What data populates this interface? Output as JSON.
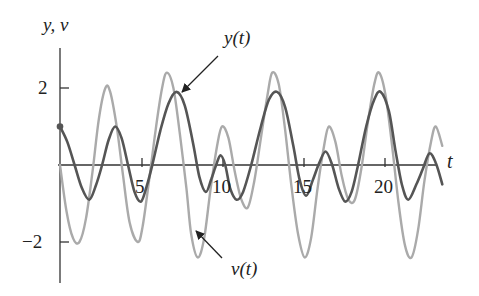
{
  "chart_data": {
    "type": "line",
    "title": "",
    "xlabel": "t",
    "ylabel": "y, v",
    "xlim": [
      0,
      23
    ],
    "ylim": [
      -3,
      3
    ],
    "grid": false,
    "x_ticks": [
      5,
      10,
      15,
      20
    ],
    "x_tick_labels": [
      "5",
      "10",
      "15",
      "20"
    ],
    "y_ticks": [
      2,
      -2
    ],
    "y_tick_labels": [
      "2",
      "−2"
    ],
    "legend": "annotations with arrows",
    "series": [
      {
        "name": "y(t)",
        "color": "#555555",
        "width": 2.6,
        "initial_point": [
          0,
          1.0
        ],
        "points": [
          [
            0,
            1.0
          ],
          [
            0.45,
            0.6
          ],
          [
            0.9,
            0.0
          ],
          [
            1.35,
            -0.6
          ],
          [
            1.8,
            -0.9
          ],
          [
            2.2,
            -0.55
          ],
          [
            2.6,
            0.0
          ],
          [
            3.0,
            0.65
          ],
          [
            3.4,
            1.0
          ],
          [
            3.8,
            0.7
          ],
          [
            4.2,
            0.0
          ],
          [
            4.6,
            -0.7
          ],
          [
            5.0,
            -0.95
          ],
          [
            5.35,
            -0.55
          ],
          [
            5.7,
            0.0
          ],
          [
            6.2,
            0.9
          ],
          [
            6.7,
            1.6
          ],
          [
            7.2,
            1.9
          ],
          [
            7.7,
            1.55
          ],
          [
            8.2,
            0.6
          ],
          [
            8.6,
            -0.3
          ],
          [
            9.0,
            -0.7
          ],
          [
            9.35,
            -0.35
          ],
          [
            9.6,
            -0.05
          ],
          [
            9.9,
            0.25
          ],
          [
            10.2,
            0.0
          ],
          [
            10.5,
            -0.6
          ],
          [
            10.9,
            -0.9
          ],
          [
            11.3,
            -0.7
          ],
          [
            11.8,
            0.0
          ],
          [
            12.4,
            1.0
          ],
          [
            12.9,
            1.7
          ],
          [
            13.4,
            1.9
          ],
          [
            13.9,
            1.5
          ],
          [
            14.4,
            0.5
          ],
          [
            14.8,
            -0.4
          ],
          [
            15.2,
            -0.8
          ],
          [
            15.6,
            -0.4
          ],
          [
            16.0,
            0.05
          ],
          [
            16.4,
            0.35
          ],
          [
            16.8,
            0.0
          ],
          [
            17.2,
            -0.6
          ],
          [
            17.6,
            -0.95
          ],
          [
            18.0,
            -0.7
          ],
          [
            18.4,
            0.0
          ],
          [
            18.9,
            1.0
          ],
          [
            19.4,
            1.7
          ],
          [
            19.8,
            1.9
          ],
          [
            20.3,
            1.4
          ],
          [
            20.7,
            0.4
          ],
          [
            21.1,
            -0.5
          ],
          [
            21.5,
            -0.9
          ],
          [
            22.0,
            -0.5
          ],
          [
            22.4,
            -0.1
          ],
          [
            22.8,
            0.3
          ],
          [
            23.2,
            0.05
          ],
          [
            23.6,
            -0.5
          ]
        ]
      },
      {
        "name": "v(t)",
        "color": "#aaaaaa",
        "width": 2.4,
        "points": [
          [
            0,
            0.0
          ],
          [
            0.4,
            -1.2
          ],
          [
            0.8,
            -1.9
          ],
          [
            1.2,
            -2.0
          ],
          [
            1.6,
            -1.4
          ],
          [
            2.0,
            -0.2
          ],
          [
            2.4,
            1.2
          ],
          [
            2.8,
            2.0
          ],
          [
            3.1,
            1.9
          ],
          [
            3.5,
            1.0
          ],
          [
            3.9,
            -0.3
          ],
          [
            4.3,
            -1.5
          ],
          [
            4.8,
            -2.0
          ],
          [
            5.1,
            -1.6
          ],
          [
            5.5,
            -0.4
          ],
          [
            5.9,
            0.9
          ],
          [
            6.3,
            2.0
          ],
          [
            6.6,
            2.4
          ],
          [
            7.0,
            2.0
          ],
          [
            7.4,
            0.8
          ],
          [
            7.8,
            -0.6
          ],
          [
            8.1,
            -1.8
          ],
          [
            8.5,
            -2.4
          ],
          [
            8.9,
            -1.9
          ],
          [
            9.3,
            -0.6
          ],
          [
            9.7,
            0.5
          ],
          [
            10.0,
            1.0
          ],
          [
            10.4,
            0.7
          ],
          [
            10.8,
            -0.2
          ],
          [
            11.2,
            -0.9
          ],
          [
            11.6,
            -1.1
          ],
          [
            12.0,
            -0.4
          ],
          [
            12.4,
            0.7
          ],
          [
            12.8,
            1.8
          ],
          [
            13.1,
            2.4
          ],
          [
            13.5,
            2.1
          ],
          [
            13.9,
            0.9
          ],
          [
            14.3,
            -0.6
          ],
          [
            14.7,
            -1.8
          ],
          [
            15.1,
            -2.4
          ],
          [
            15.5,
            -1.9
          ],
          [
            15.9,
            -0.6
          ],
          [
            16.3,
            0.5
          ],
          [
            16.6,
            1.0
          ],
          [
            17.0,
            0.6
          ],
          [
            17.4,
            -0.3
          ],
          [
            17.8,
            -0.9
          ],
          [
            18.2,
            -0.9
          ],
          [
            18.6,
            -0.1
          ],
          [
            19.0,
            1.1
          ],
          [
            19.4,
            2.1
          ],
          [
            19.7,
            2.4
          ],
          [
            20.1,
            1.8
          ],
          [
            20.5,
            0.5
          ],
          [
            20.9,
            -1.0
          ],
          [
            21.3,
            -2.1
          ],
          [
            21.7,
            -2.4
          ],
          [
            22.1,
            -1.7
          ],
          [
            22.5,
            -0.4
          ],
          [
            22.9,
            0.6
          ],
          [
            23.2,
            1.0
          ],
          [
            23.6,
            0.5
          ]
        ]
      }
    ],
    "annotations": [
      {
        "text": "y(t)",
        "target_series": "y(t)",
        "position": "upper center, arrow pointing down-left to y peak near t≈7.2"
      },
      {
        "text": "v(t)",
        "target_series": "v(t)",
        "position": "lower center, arrow pointing up-left to v curve near t≈8.5"
      }
    ]
  },
  "labels": {
    "yaxis": "y, v",
    "xaxis": "t",
    "y_annotation": "y(t)",
    "v_annotation": "v(t)",
    "tick_2": "2",
    "tick_neg2": "−2",
    "tick_5": "5",
    "tick_10": "10",
    "tick_15": "15",
    "tick_20": "20"
  }
}
